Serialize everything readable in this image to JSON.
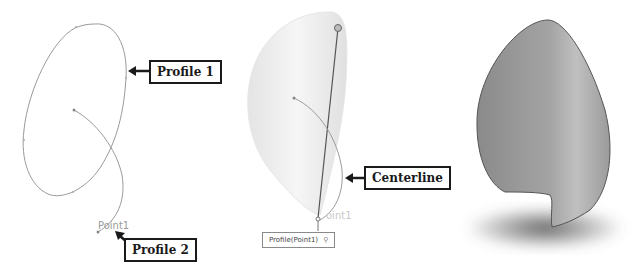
{
  "figure": {
    "panels": [
      {
        "id": "sketch",
        "callouts": [
          {
            "label": "Profile 1"
          },
          {
            "label": "Profile 2"
          }
        ],
        "sketch_labels": [
          {
            "label": "Point1"
          }
        ]
      },
      {
        "id": "preview",
        "callouts": [
          {
            "label": "Centerline"
          }
        ],
        "sketch_labels": [
          {
            "label": "oint1"
          }
        ],
        "tag": {
          "label": "Profile(Point1)"
        }
      },
      {
        "id": "result"
      }
    ]
  },
  "colors": {
    "sketch_line": "#9a9a9a",
    "callout_border": "#1a1a1a",
    "surface_light": "#f0f0f0",
    "surface_dark": "#7a7a7a",
    "shadow": "#555555"
  }
}
